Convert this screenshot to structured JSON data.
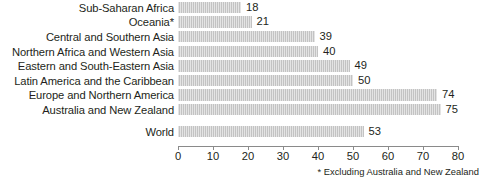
{
  "chart_data": {
    "type": "bar",
    "orientation": "horizontal",
    "title": "",
    "xlabel": "",
    "ylabel": "",
    "xlim": [
      0,
      80
    ],
    "xticks": [
      "0",
      "10",
      "20",
      "30",
      "40",
      "50",
      "60",
      "70",
      "80"
    ],
    "grid": false,
    "legend": null,
    "bar_color": "#c3c3c3",
    "categories": [
      "Sub-Saharan Africa",
      "Oceania*",
      "Central and Southern Asia",
      "Northern Africa and Western Asia",
      "Eastern and South-Eastern Asia",
      "Latin America and the Caribbean",
      "Europe and Northern America",
      "Australia and New Zealand",
      "World"
    ],
    "values": [
      18,
      21,
      39,
      40,
      49,
      50,
      74,
      75,
      53
    ],
    "data_labels": [
      "18",
      "21",
      "39",
      "40",
      "49",
      "50",
      "74",
      "75",
      "53"
    ],
    "annotations": [
      "* Excluding Australia and New Zealand"
    ]
  },
  "footnote": "* Excluding Australia and New Zealand"
}
